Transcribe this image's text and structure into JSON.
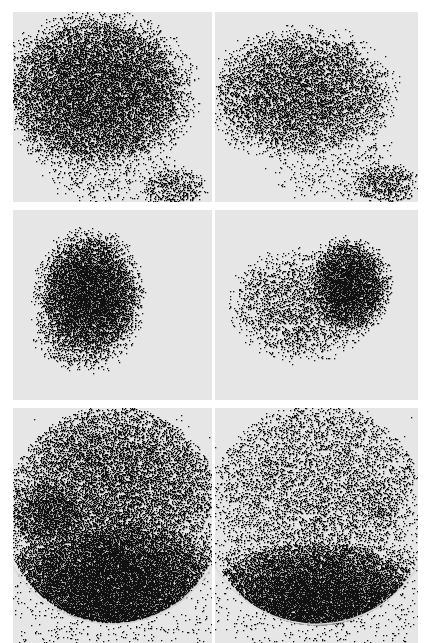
{
  "figure": {
    "background_color": "#ffffff",
    "panel_background": "#e6e6e6",
    "ink_color": "#111111",
    "panels": [
      {
        "id": "r1c1",
        "row": 1,
        "col": 1,
        "x": 13,
        "y": 12,
        "w": 199,
        "h": 190,
        "blobs": [
          {
            "cx": 0.42,
            "cy": 0.42,
            "rx": 0.42,
            "ry": 0.36,
            "d": 0.75
          },
          {
            "cx": 0.55,
            "cy": 0.32,
            "rx": 0.18,
            "ry": 0.2,
            "d": 0.6
          },
          {
            "cx": 0.8,
            "cy": 0.92,
            "rx": 0.15,
            "ry": 0.1,
            "d": 0.35
          },
          {
            "cx": 0.5,
            "cy": 0.85,
            "rx": 0.3,
            "ry": 0.15,
            "d": 0.12
          }
        ]
      },
      {
        "id": "r1c2",
        "row": 1,
        "col": 2,
        "x": 215,
        "y": 12,
        "w": 203,
        "h": 190,
        "blobs": [
          {
            "cx": 0.42,
            "cy": 0.43,
            "rx": 0.4,
            "ry": 0.3,
            "d": 0.55
          },
          {
            "cx": 0.62,
            "cy": 0.45,
            "rx": 0.15,
            "ry": 0.15,
            "d": 0.35
          },
          {
            "cx": 0.83,
            "cy": 0.9,
            "rx": 0.15,
            "ry": 0.1,
            "d": 0.45
          },
          {
            "cx": 0.6,
            "cy": 0.8,
            "rx": 0.3,
            "ry": 0.18,
            "d": 0.08
          }
        ]
      },
      {
        "id": "r2c1",
        "row": 2,
        "col": 1,
        "x": 13,
        "y": 210,
        "w": 199,
        "h": 190,
        "blobs": [
          {
            "cx": 0.38,
            "cy": 0.45,
            "rx": 0.23,
            "ry": 0.3,
            "d": 0.98
          },
          {
            "cx": 0.35,
            "cy": 0.62,
            "rx": 0.22,
            "ry": 0.2,
            "d": 0.4
          }
        ]
      },
      {
        "id": "r2c2",
        "row": 2,
        "col": 2,
        "x": 215,
        "y": 210,
        "w": 203,
        "h": 190,
        "blobs": [
          {
            "cx": 0.65,
            "cy": 0.4,
            "rx": 0.18,
            "ry": 0.22,
            "d": 0.98
          },
          {
            "cx": 0.42,
            "cy": 0.5,
            "rx": 0.3,
            "ry": 0.25,
            "d": 0.35
          }
        ]
      },
      {
        "id": "r3c1",
        "row": 3,
        "col": 1,
        "x": 13,
        "y": 408,
        "w": 199,
        "h": 235,
        "blobs": [
          {
            "cx": 0.5,
            "cy": 0.8,
            "rx": 0.55,
            "ry": 0.35,
            "d": 1.0
          },
          {
            "cx": 0.5,
            "cy": 0.35,
            "rx": 0.5,
            "ry": 0.35,
            "d": 0.55
          },
          {
            "cx": 0.2,
            "cy": 0.45,
            "rx": 0.2,
            "ry": 0.15,
            "d": 0.8
          }
        ],
        "arc": true
      },
      {
        "id": "r3c2",
        "row": 3,
        "col": 2,
        "x": 215,
        "y": 408,
        "w": 203,
        "h": 235,
        "blobs": [
          {
            "cx": 0.5,
            "cy": 0.85,
            "rx": 0.55,
            "ry": 0.28,
            "d": 1.0
          },
          {
            "cx": 0.5,
            "cy": 0.35,
            "rx": 0.5,
            "ry": 0.38,
            "d": 0.28
          },
          {
            "cx": 0.8,
            "cy": 0.4,
            "rx": 0.12,
            "ry": 0.1,
            "d": 0.4
          }
        ],
        "arc": true
      }
    ]
  }
}
